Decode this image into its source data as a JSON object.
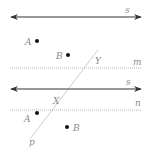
{
  "colors": {
    "line": "#333333",
    "dotted": "#b5b5b5",
    "transversal": "#c8c8c8",
    "label": "#8a8a8a",
    "point": "#111111"
  },
  "figure1": {
    "line_s": {
      "label": "s"
    },
    "line_m": {
      "label": "m"
    },
    "point_a": {
      "label": "A"
    },
    "point_b": {
      "label": "B"
    },
    "intersection_y": {
      "label": "Y"
    }
  },
  "figure2": {
    "line_s": {
      "label": "s"
    },
    "line_n": {
      "label": "n"
    },
    "point_a": {
      "label": "A"
    },
    "point_b": {
      "label": "B"
    },
    "intersection_x": {
      "label": "X"
    },
    "transversal_p": {
      "label": "p"
    }
  }
}
